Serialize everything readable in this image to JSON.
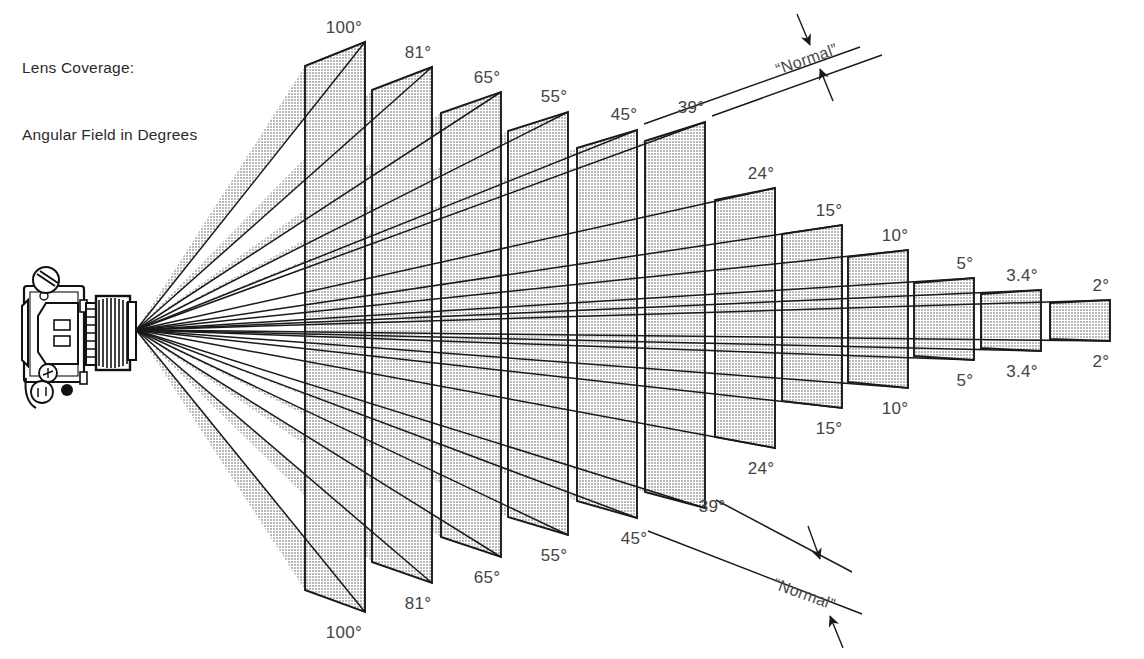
{
  "title": {
    "line1": "Lens Coverage:",
    "line2": "Angular Field in Degrees"
  },
  "colors": {
    "background": "#ffffff",
    "frame_fill": "#c9c9c9",
    "frame_stroke": "#1a1a1a",
    "wedge_fill": "#c9c9c9",
    "text": "#444444",
    "camera_body": "#ffffff",
    "camera_outline": "#111111"
  },
  "camera": {
    "name": "35mm SLR camera, top view, lens pointing right",
    "apex_x": 136,
    "apex_y": 330
  },
  "annotations": {
    "normal_top": "“Normal”",
    "normal_bottom": "“Normal”"
  },
  "chart_data": {
    "type": "diagram",
    "title": "Lens Coverage: Angular Field in Degrees",
    "xlabel": "",
    "ylabel": "",
    "angles": [
      100,
      81,
      65,
      55,
      45,
      39,
      24,
      15,
      10,
      5,
      3.4,
      2
    ],
    "labels_top": [
      "100°",
      "81°",
      "65°",
      "55°",
      "45°",
      "39°",
      "24°",
      "15°",
      "10°",
      "5°",
      "3.4°",
      "2°"
    ],
    "labels_bottom": [
      "100°",
      "81°",
      "65°",
      "55°",
      "45°",
      "39°",
      "24°",
      "15°",
      "10°",
      "5°",
      "3.4°",
      "2°"
    ],
    "normal_range": [
      "45°",
      "39°"
    ],
    "frames": [
      {
        "angle": "100°",
        "x": 365,
        "top": 42,
        "bottom": 612,
        "left_x": 305,
        "left_top": 66,
        "left_bottom": 590
      },
      {
        "angle": "81°",
        "x": 432,
        "top": 67,
        "bottom": 583,
        "left_x": 372,
        "left_top": 90,
        "left_bottom": 562
      },
      {
        "angle": "65°",
        "x": 501,
        "top": 92,
        "bottom": 557,
        "left_x": 441,
        "left_top": 113,
        "left_bottom": 537
      },
      {
        "angle": "55°",
        "x": 568,
        "top": 112,
        "bottom": 535,
        "left_x": 508,
        "left_top": 131,
        "left_bottom": 517
      },
      {
        "angle": "45°",
        "x": 637,
        "top": 130,
        "bottom": 518,
        "left_x": 577,
        "left_top": 148,
        "left_bottom": 501
      },
      {
        "angle": "39°",
        "x": 705,
        "top": 122,
        "bottom": 508,
        "left_x": 645,
        "left_top": 141,
        "left_bottom": 492
      },
      {
        "angle": "24°",
        "x": 775,
        "top": 188,
        "bottom": 448,
        "left_x": 715,
        "left_top": 200,
        "left_bottom": 437
      },
      {
        "angle": "15°",
        "x": 842,
        "top": 225,
        "bottom": 408,
        "left_x": 782,
        "left_top": 234,
        "left_bottom": 401
      },
      {
        "angle": "10°",
        "x": 908,
        "top": 250,
        "bottom": 388,
        "left_x": 848,
        "left_top": 257,
        "left_bottom": 382
      },
      {
        "angle": "5°",
        "x": 974,
        "top": 278,
        "bottom": 360,
        "left_x": 914,
        "left_top": 283,
        "left_bottom": 356
      },
      {
        "angle": "3.4°",
        "x": 1041,
        "top": 290,
        "bottom": 351,
        "left_x": 981,
        "left_top": 294,
        "left_bottom": 348
      },
      {
        "angle": "2°",
        "x": 1110,
        "top": 300,
        "bottom": 341,
        "left_x": 1050,
        "left_top": 303,
        "left_bottom": 339
      }
    ],
    "label_positions_top": [
      {
        "text": "100°",
        "x": 344,
        "y": 33
      },
      {
        "text": "81°",
        "x": 418,
        "y": 58
      },
      {
        "text": "65°",
        "x": 487,
        "y": 83
      },
      {
        "text": "55°",
        "x": 554,
        "y": 102
      },
      {
        "text": "45°",
        "x": 624,
        "y": 120
      },
      {
        "text": "39°",
        "x": 691,
        "y": 113
      },
      {
        "text": "24°",
        "x": 761,
        "y": 179
      },
      {
        "text": "15°",
        "x": 829,
        "y": 216
      },
      {
        "text": "10°",
        "x": 895,
        "y": 241
      },
      {
        "text": "5°",
        "x": 965,
        "y": 269
      },
      {
        "text": "3.4°",
        "x": 1022,
        "y": 281
      },
      {
        "text": "2°",
        "x": 1101,
        "y": 291
      }
    ],
    "label_positions_bottom": [
      {
        "text": "100°",
        "x": 344,
        "y": 638
      },
      {
        "text": "81°",
        "x": 418,
        "y": 609
      },
      {
        "text": "65°",
        "x": 487,
        "y": 583
      },
      {
        "text": "55°",
        "x": 554,
        "y": 561
      },
      {
        "text": "45°",
        "x": 634,
        "y": 544
      },
      {
        "text": "39°",
        "x": 712,
        "y": 512
      },
      {
        "text": "24°",
        "x": 761,
        "y": 474
      },
      {
        "text": "15°",
        "x": 829,
        "y": 434
      },
      {
        "text": "10°",
        "x": 895,
        "y": 414
      },
      {
        "text": "5°",
        "x": 965,
        "y": 386
      },
      {
        "text": "3.4°",
        "x": 1022,
        "y": 377
      },
      {
        "text": "2°",
        "x": 1101,
        "y": 367
      }
    ]
  }
}
